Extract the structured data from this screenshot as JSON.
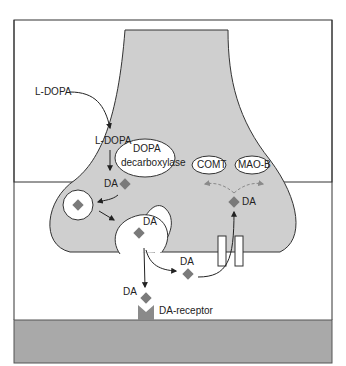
{
  "labels": {
    "ldopa_outside": "L-DOPA",
    "ldopa_inside": "L-DOPA",
    "enzyme": "DOPA decarboxylase",
    "enzyme_line1": "DOPA",
    "enzyme_line2": "decarboxylase",
    "comt": "COMT",
    "maob": "MAO-B",
    "da_1": "DA",
    "da_vesicle": "DA",
    "da_cleft": "DA",
    "da_receptor": "DA",
    "da_reuptake": "DA",
    "receptor": "DA-receptor"
  },
  "colors": {
    "neuron_fill": "#cfcfcf",
    "postsynaptic_fill": "#a9a9a9",
    "diamond": "#7a7a7a",
    "receptor": "#8a8a8a",
    "outline": "#333333",
    "dashed_arrow": "#8a8a8a"
  }
}
